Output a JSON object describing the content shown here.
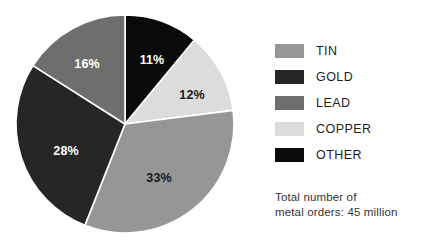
{
  "chart_data": {
    "type": "pie",
    "title": "",
    "categories": [
      "OTHER",
      "COPPER",
      "TIN",
      "GOLD",
      "LEAD"
    ],
    "values": [
      11,
      12,
      33,
      28,
      16
    ],
    "value_unit": "%",
    "data_labels": [
      "11%",
      "12%",
      "33%",
      "28%",
      "16%"
    ],
    "legend_position": "right",
    "grid": false,
    "start_angle_deg": 0,
    "direction": "clockwise",
    "colors": {
      "TIN": "#969696",
      "GOLD": "#262626",
      "LEAD": "#6e6e6e",
      "COPPER": "#dcdcdc",
      "OTHER": "#0a0a0a"
    },
    "label_text_colors": {
      "TIN": "#1a1a1a",
      "GOLD": "#ffffff",
      "LEAD": "#ffffff",
      "COPPER": "#1a1a1a",
      "OTHER": "#ffffff"
    },
    "slices": [
      {
        "name": "OTHER",
        "value": 11,
        "label": "11%",
        "color": "#0a0a0a",
        "label_color": "#ffffff",
        "label_x": 152,
        "label_y": 61
      },
      {
        "name": "COPPER",
        "value": 12,
        "label": "12%",
        "color": "#dcdcdc",
        "label_color": "#1a1a1a",
        "label_x": 192,
        "label_y": 96
      },
      {
        "name": "TIN",
        "value": 33,
        "label": "33%",
        "color": "#969696",
        "label_color": "#1a1a1a",
        "label_x": 159,
        "label_y": 179
      },
      {
        "name": "GOLD",
        "value": 28,
        "label": "28%",
        "color": "#262626",
        "label_color": "#ffffff",
        "label_x": 66,
        "label_y": 152
      },
      {
        "name": "LEAD",
        "value": 16,
        "label": "16%",
        "color": "#6e6e6e",
        "label_color": "#ffffff",
        "label_x": 87,
        "label_y": 65
      }
    ],
    "geometry": {
      "cx": 125,
      "cy": 124,
      "r": 109
    }
  },
  "legend": {
    "items": [
      {
        "label": "TIN",
        "color": "#969696"
      },
      {
        "label": "GOLD",
        "color": "#262626"
      },
      {
        "label": "LEAD",
        "color": "#6e6e6e"
      },
      {
        "label": "COPPER",
        "color": "#dcdcdc"
      },
      {
        "label": "OTHER",
        "color": "#0a0a0a"
      }
    ]
  },
  "footnote": {
    "line1": "Total number of",
    "line2": "metal orders: 45 million"
  }
}
